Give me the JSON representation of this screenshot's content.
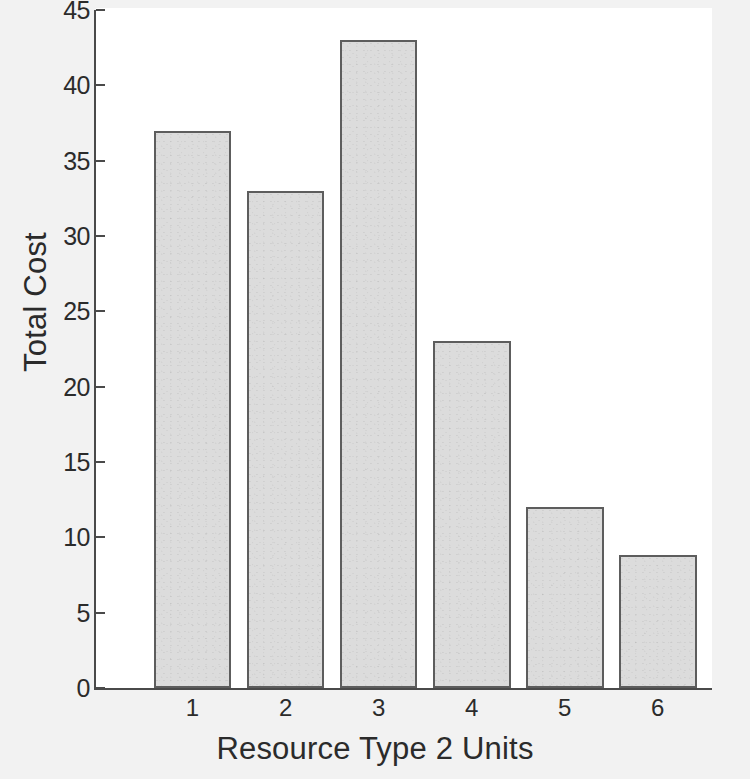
{
  "chart_data": {
    "type": "bar",
    "title": "",
    "subtitle": "",
    "xlabel": "Resource Type 2 Units",
    "ylabel": "Total Cost",
    "categories": [
      "1",
      "2",
      "3",
      "4",
      "5",
      "6"
    ],
    "values": [
      37,
      33,
      43,
      23,
      12,
      8.8
    ],
    "series": [
      {
        "name": "Total Cost",
        "values": [
          37,
          33,
          43,
          23,
          12,
          8.8
        ]
      }
    ],
    "ylim": [
      0,
      45
    ],
    "y_ticks": [
      0,
      5,
      10,
      15,
      20,
      25,
      30,
      35,
      40,
      45
    ],
    "y_tick_labels": [
      "0",
      "5",
      "10",
      "15",
      "20",
      "25",
      "30",
      "35",
      "40",
      "45"
    ],
    "x_tick_labels": [
      "1",
      "2",
      "3",
      "4",
      "5",
      "6"
    ],
    "grid": false,
    "legend": false,
    "legend_position": "none",
    "annotations": [],
    "colors": {
      "bar_fill": "#dcdcdc",
      "bar_edge": "#5d5d5d",
      "axis": "#4a4a4a",
      "text": "#2b2b2b",
      "plot_background": "#ffffff",
      "figure_background": "#f2f2f2"
    }
  }
}
